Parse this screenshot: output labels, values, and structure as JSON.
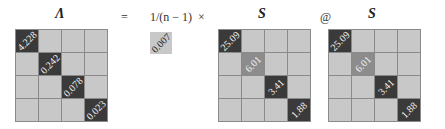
{
  "equation": {
    "lhs_title": "Λ",
    "equals": "=",
    "scalar_title": "1/(n − 1)",
    "times": "×",
    "at": "@",
    "s1_title": "S",
    "s2_title": "S"
  },
  "lambda_matrix": {
    "diag": [
      "4.228",
      "0.242",
      "0.078",
      "0.023"
    ]
  },
  "scalar": {
    "value": "0.007"
  },
  "s_matrix_1": {
    "diag": [
      "25.09",
      "6.01",
      "3.41",
      "1.88"
    ]
  },
  "s_matrix_2": {
    "diag": [
      "25.09",
      "6.01",
      "3.41",
      "1.88"
    ]
  },
  "colors": {
    "dark": "#3a3a3a",
    "mid": "#8c8c8c",
    "light": "#c8c8c8",
    "grid": "#8a8a8a"
  }
}
